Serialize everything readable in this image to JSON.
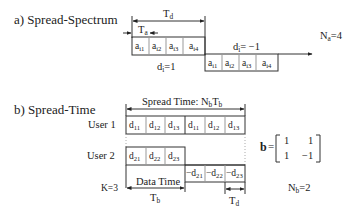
{
  "section_a": {
    "title": "a) Spread-Spectrum",
    "td_label": "T",
    "td_sub": "d",
    "ta_label": "T",
    "ta_sub": "a",
    "symbol1": {
      "label": "d",
      "sub": "i",
      "value": "=1",
      "chips": [
        {
          "t": "a",
          "s": "i1"
        },
        {
          "t": "a",
          "s": "i2"
        },
        {
          "t": "a",
          "s": "i3"
        },
        {
          "t": "a",
          "s": "i4"
        }
      ]
    },
    "symbol2": {
      "label": "d",
      "sub": "i",
      "value": "= −1",
      "chips": [
        {
          "t": "a",
          "s": "i1"
        },
        {
          "t": "a",
          "s": "i2"
        },
        {
          "t": "a",
          "s": "i3"
        },
        {
          "t": "a",
          "s": "i4"
        }
      ]
    },
    "na_label": "N",
    "na_sub": "a",
    "na_value": "=4"
  },
  "section_b": {
    "title": "b) Spread-Time",
    "spread_time_label": "Spread Time:  N",
    "spread_time_sub1": "b",
    "spread_time_mid": "T",
    "spread_time_sub2": "b",
    "user1_label": "User  1",
    "user2_label": "User 2",
    "user1_cells": [
      {
        "t": "d",
        "s": "11"
      },
      {
        "t": "d",
        "s": "12"
      },
      {
        "t": "d",
        "s": "13"
      },
      {
        "t": "d",
        "s": "11"
      },
      {
        "t": "d",
        "s": "12"
      },
      {
        "t": "d",
        "s": "13"
      }
    ],
    "user2_cells_pos": [
      {
        "t": "d",
        "s": "21"
      },
      {
        "t": "d",
        "s": "22"
      },
      {
        "t": "d",
        "s": "23"
      }
    ],
    "user2_cells_neg": [
      {
        "t": "−d",
        "s": "21"
      },
      {
        "t": "−d",
        "s": "22"
      },
      {
        "t": "−d",
        "s": "23"
      }
    ],
    "k_label": "K=3",
    "data_time_label": "Data Time",
    "tb_label": "T",
    "tb_sub": "b",
    "td_label": "T",
    "td_sub": "d",
    "matrix_label": "b",
    "matrix_eq": "=",
    "matrix": [
      [
        "1",
        "1"
      ],
      [
        "1",
        "−1"
      ]
    ],
    "nb_label": "N",
    "nb_sub": "b",
    "nb_value": "=2"
  }
}
